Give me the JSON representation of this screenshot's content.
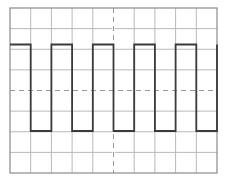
{
  "display": {
    "kind": "oscilloscope-graticule",
    "width": 227,
    "height": 181,
    "background_color": "#ffffff",
    "grid": {
      "left": 10,
      "top": 8,
      "right": 217,
      "bottom": 173,
      "columns": 10,
      "rows": 8,
      "cell_width": 20.7,
      "cell_height": 20.625,
      "minor_line_color": "#b9b9b9",
      "minor_line_width": 1,
      "border_color": "#8a8a8a",
      "border_width": 1.2,
      "center_line_color": "#9a9a9a",
      "center_line_width": 1,
      "center_line_dash": "5,4",
      "center_vertical_x": 113.5,
      "center_horizontal_y": 90.5
    },
    "trace": {
      "label": "square-wave",
      "color": "#3a3a3a",
      "line_width": 1.8,
      "high_y": 44.5,
      "low_y": 131.0,
      "start_x": 10,
      "end_x": 217,
      "starts_high": true,
      "half_period_px": 20.7,
      "duty_cycle_percent": 50,
      "amplitude_divisions": 4.2,
      "period_divisions": 2,
      "cycles_visible": 5
    }
  },
  "chart_data": {
    "type": "line",
    "subtitle": "",
    "xlabel": "",
    "ylabel": "",
    "grid": true,
    "legend": "none",
    "xlim": [
      0,
      10
    ],
    "ylim": [
      -4,
      4
    ],
    "x_tick_labels": [],
    "y_tick_labels": [],
    "series": [
      {
        "name": "square-wave",
        "color": "#3a3a3a",
        "waveform": "square",
        "period_divisions": 2,
        "duty_cycle_percent": 50,
        "high_level_divisions": 2.1,
        "low_level_divisions": -2.1,
        "x": [
          0,
          0,
          1,
          1,
          2,
          2,
          3,
          3,
          4,
          4,
          5,
          5,
          6,
          6,
          7,
          7,
          8,
          8,
          9,
          9,
          10
        ],
        "values": [
          2.1,
          2.1,
          2.1,
          -2.1,
          -2.1,
          2.1,
          2.1,
          -2.1,
          -2.1,
          2.1,
          2.1,
          -2.1,
          -2.1,
          2.1,
          2.1,
          -2.1,
          -2.1,
          2.1,
          2.1,
          -2.1,
          -2.1
        ]
      }
    ],
    "annotations": []
  }
}
